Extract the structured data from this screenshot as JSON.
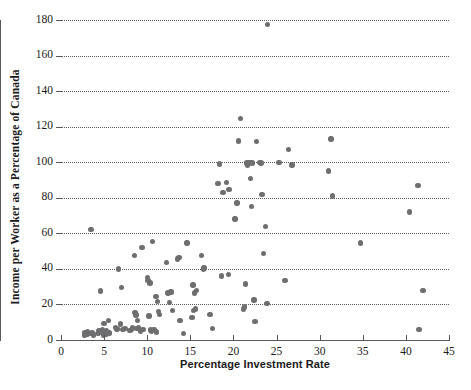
{
  "chart": {
    "type": "scatter",
    "title": "",
    "xlabel": "Percentage Investment Rate",
    "ylabel": "Income per Worker as a Percentage of Canada"
  },
  "chart_data": {
    "type": "scatter",
    "title": "",
    "xlabel": "Percentage Investment Rate",
    "ylabel": "Income per Worker as a Percentage of Canada",
    "xlim": [
      0,
      45
    ],
    "ylim": [
      0,
      180
    ],
    "xticks": [
      0,
      5,
      10,
      15,
      20,
      25,
      30,
      35,
      40,
      45
    ],
    "yticks": [
      0,
      20,
      40,
      60,
      80,
      100,
      120,
      140,
      160,
      180
    ],
    "grid": "horizontal-dotted",
    "legend": "none",
    "marker": {
      "shape": "circle",
      "color": "#6e6e70",
      "size": 5.4
    },
    "points": [
      [
        2.7,
        2.5
      ],
      [
        2.8,
        4.0
      ],
      [
        3.0,
        3.2
      ],
      [
        3.1,
        4.4
      ],
      [
        3.3,
        3.8
      ],
      [
        3.5,
        62.0
      ],
      [
        3.6,
        4.0
      ],
      [
        3.8,
        2.6
      ],
      [
        4.3,
        3.6
      ],
      [
        4.4,
        5.0
      ],
      [
        4.6,
        27.5
      ],
      [
        4.7,
        4.2
      ],
      [
        4.8,
        6.0
      ],
      [
        4.9,
        2.8
      ],
      [
        5.0,
        9.3
      ],
      [
        5.1,
        4.6
      ],
      [
        5.2,
        3.4
      ],
      [
        5.3,
        5.4
      ],
      [
        5.5,
        11.0
      ],
      [
        5.6,
        4.0
      ],
      [
        6.3,
        7.0
      ],
      [
        6.5,
        6.2
      ],
      [
        6.7,
        40.0
      ],
      [
        6.9,
        9.0
      ],
      [
        7.0,
        29.5
      ],
      [
        7.2,
        6.0
      ],
      [
        7.4,
        6.6
      ],
      [
        8.0,
        5.2
      ],
      [
        8.2,
        6.0
      ],
      [
        8.3,
        6.8
      ],
      [
        8.5,
        47.5
      ],
      [
        8.6,
        15.5
      ],
      [
        8.7,
        14.0
      ],
      [
        8.8,
        6.4
      ],
      [
        8.9,
        11.0
      ],
      [
        9.0,
        7.2
      ],
      [
        9.2,
        5.0
      ],
      [
        9.4,
        52.0
      ],
      [
        9.5,
        6.0
      ],
      [
        10.0,
        35.0
      ],
      [
        10.1,
        33.5
      ],
      [
        10.2,
        13.5
      ],
      [
        10.3,
        32.0
      ],
      [
        10.4,
        5.6
      ],
      [
        10.5,
        5.0
      ],
      [
        10.6,
        55.5
      ],
      [
        10.8,
        6.0
      ],
      [
        11.0,
        24.5
      ],
      [
        11.1,
        4.5
      ],
      [
        11.2,
        21.5
      ],
      [
        11.3,
        16.0
      ],
      [
        11.4,
        14.5
      ],
      [
        12.2,
        43.5
      ],
      [
        12.4,
        26.5
      ],
      [
        12.6,
        21.0
      ],
      [
        12.7,
        27.0
      ],
      [
        12.8,
        27.0
      ],
      [
        12.9,
        16.5
      ],
      [
        13.5,
        45.5
      ],
      [
        13.7,
        46.5
      ],
      [
        13.8,
        11.0
      ],
      [
        14.2,
        3.5
      ],
      [
        14.6,
        54.5
      ],
      [
        15.2,
        12.5
      ],
      [
        15.3,
        31.0
      ],
      [
        15.4,
        16.5
      ],
      [
        15.5,
        26.5
      ],
      [
        15.6,
        17.5
      ],
      [
        15.7,
        28.0
      ],
      [
        16.3,
        47.5
      ],
      [
        16.5,
        39.5
      ],
      [
        16.6,
        40.5
      ],
      [
        17.3,
        14.5
      ],
      [
        17.6,
        6.5
      ],
      [
        18.2,
        88.0
      ],
      [
        18.4,
        99.0
      ],
      [
        18.6,
        36.0
      ],
      [
        18.8,
        83.0
      ],
      [
        19.2,
        88.5
      ],
      [
        19.4,
        37.0
      ],
      [
        19.5,
        84.5
      ],
      [
        20.2,
        68.0
      ],
      [
        20.4,
        77.0
      ],
      [
        20.6,
        112.0
      ],
      [
        20.8,
        124.5
      ],
      [
        21.2,
        17.5
      ],
      [
        21.3,
        18.5
      ],
      [
        21.4,
        31.5
      ],
      [
        21.5,
        99.5
      ],
      [
        21.6,
        98.5
      ],
      [
        21.8,
        99.5
      ],
      [
        21.9,
        100.0
      ],
      [
        22.0,
        91.0
      ],
      [
        22.1,
        75.0
      ],
      [
        22.2,
        99.5
      ],
      [
        22.4,
        22.5
      ],
      [
        22.5,
        10.5
      ],
      [
        22.7,
        111.5
      ],
      [
        23.0,
        100.0
      ],
      [
        23.2,
        99.5
      ],
      [
        23.3,
        82.0
      ],
      [
        23.5,
        48.5
      ],
      [
        23.7,
        64.0
      ],
      [
        23.9,
        20.5
      ],
      [
        23.95,
        177.5
      ],
      [
        25.3,
        100.0
      ],
      [
        26.0,
        33.5
      ],
      [
        26.4,
        107.0
      ],
      [
        26.8,
        98.5
      ],
      [
        31.0,
        95.0
      ],
      [
        31.3,
        113.0
      ],
      [
        31.5,
        81.0
      ],
      [
        34.7,
        54.5
      ],
      [
        40.4,
        72.0
      ],
      [
        41.4,
        87.0
      ],
      [
        41.5,
        6.0
      ],
      [
        42.0,
        28.0
      ]
    ]
  }
}
